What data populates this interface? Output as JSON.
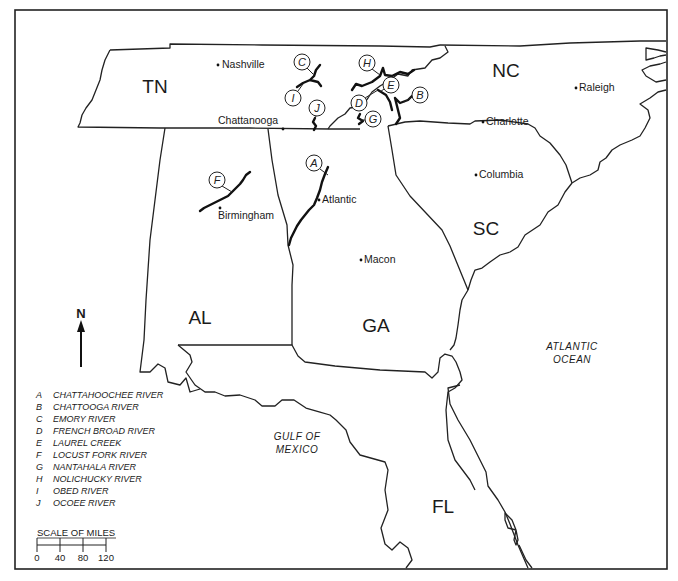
{
  "map": {
    "states": [
      {
        "id": "tn",
        "label": "TN",
        "x": 155,
        "y": 93
      },
      {
        "id": "nc",
        "label": "NC",
        "x": 506,
        "y": 77
      },
      {
        "id": "al",
        "label": "AL",
        "x": 200,
        "y": 324
      },
      {
        "id": "ga",
        "label": "GA",
        "x": 376,
        "y": 332
      },
      {
        "id": "sc",
        "label": "SC",
        "x": 486,
        "y": 235
      },
      {
        "id": "fl",
        "label": "FL",
        "x": 443,
        "y": 513
      }
    ],
    "cities": [
      {
        "id": "nashville",
        "label": "Nashville",
        "dot_x": 218,
        "dot_y": 65,
        "label_x": 222,
        "label_y": 68
      },
      {
        "id": "chattanooga",
        "label": "Chattanooga",
        "dot_x": 283,
        "dot_y": 129,
        "label_x": 218,
        "label_y": 124
      },
      {
        "id": "raleigh",
        "label": "Raleigh",
        "dot_x": 576,
        "dot_y": 88,
        "label_x": 579,
        "label_y": 91
      },
      {
        "id": "charlotte",
        "label": "Charlotte",
        "dot_x": 483,
        "dot_y": 122,
        "label_x": 486,
        "label_y": 125
      },
      {
        "id": "columbia",
        "label": "Columbia",
        "dot_x": 476,
        "dot_y": 175,
        "label_x": 479,
        "label_y": 178
      },
      {
        "id": "atlantic",
        "label": "Atlantic",
        "dot_x": 319,
        "dot_y": 200,
        "label_x": 322,
        "label_y": 203
      },
      {
        "id": "birmingham",
        "label": "Birmingham",
        "dot_x": 220,
        "dot_y": 208,
        "label_x": 218,
        "label_y": 219
      },
      {
        "id": "macon",
        "label": "Macon",
        "dot_x": 361,
        "dot_y": 260,
        "label_x": 364,
        "label_y": 263
      }
    ],
    "water_labels": [
      {
        "id": "atlantic-ocean",
        "lines": [
          "ATLANTIC",
          "OCEAN"
        ],
        "x": 572,
        "y": 350
      },
      {
        "id": "gulf-of-mexico",
        "lines": [
          "GULF OF",
          "MEXICO"
        ],
        "x": 297,
        "y": 440
      }
    ],
    "river_markers": [
      {
        "letter": "A",
        "cx": 314,
        "cy": 163
      },
      {
        "letter": "B",
        "cx": 420,
        "cy": 95
      },
      {
        "letter": "C",
        "cx": 302,
        "cy": 62
      },
      {
        "letter": "D",
        "cx": 359,
        "cy": 103
      },
      {
        "letter": "E",
        "cx": 391,
        "cy": 85
      },
      {
        "letter": "F",
        "cx": 217,
        "cy": 180
      },
      {
        "letter": "G",
        "cx": 373,
        "cy": 119
      },
      {
        "letter": "H",
        "cx": 367,
        "cy": 63
      },
      {
        "letter": "I",
        "cx": 293,
        "cy": 98
      },
      {
        "letter": "J",
        "cx": 317,
        "cy": 108
      }
    ],
    "north_arrow": {
      "label": "N"
    }
  },
  "legend": {
    "items": [
      {
        "letter": "A",
        "name": "CHATTAHOOCHEE RIVER"
      },
      {
        "letter": "B",
        "name": "CHATTOOGA RIVER"
      },
      {
        "letter": "C",
        "name": "EMORY RIVER"
      },
      {
        "letter": "D",
        "name": "FRENCH BROAD RIVER"
      },
      {
        "letter": "E",
        "name": "LAUREL CREEK"
      },
      {
        "letter": "F",
        "name": "LOCUST FORK RIVER"
      },
      {
        "letter": "G",
        "name": "NANTAHALA RIVER"
      },
      {
        "letter": "H",
        "name": "NOLICHUCKY RIVER"
      },
      {
        "letter": "I",
        "name": "OBED RIVER"
      },
      {
        "letter": "J",
        "name": "OCOEE RIVER"
      }
    ]
  },
  "scale": {
    "title": "SCALE OF MILES",
    "ticks": [
      "0",
      "40",
      "80",
      "120"
    ]
  }
}
